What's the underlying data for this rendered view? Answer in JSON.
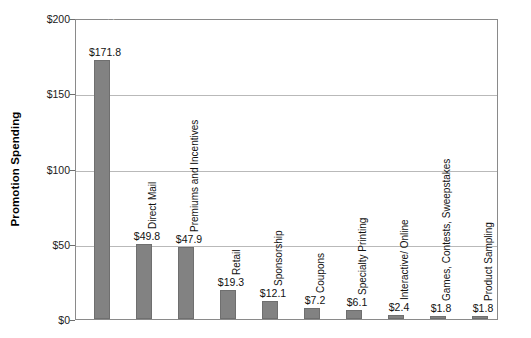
{
  "chart_data": {
    "type": "bar",
    "title": "",
    "xlabel": "",
    "ylabel": "Promotion Spending",
    "ylim": [
      0,
      200
    ],
    "ytick_labels": [
      "$200",
      "$150",
      "$100",
      "$50",
      "$0"
    ],
    "ytick_values": [
      200,
      150,
      100,
      50,
      0
    ],
    "grid": true,
    "legend": "none",
    "orientation": "vertical",
    "bar_color": "#828282",
    "categories": [
      "Event Marketing",
      "Direct Mail",
      "Premiums and Incentives",
      "Retail",
      "Sponsorship",
      "Coupons",
      "Specialty Printing",
      "Interactive/ Online",
      "Games, Contests, Sweepstakes",
      "Product Sampling"
    ],
    "values": [
      171.8,
      49.8,
      47.9,
      19.3,
      12.1,
      7.2,
      6.1,
      2.4,
      1.8,
      1.8
    ],
    "value_labels": [
      "$171.8",
      "$49.8",
      "$47.9",
      "$19.3",
      "$12.1",
      "$7.2",
      "$6.1",
      "$2.4",
      "$1.8",
      "$1.8"
    ],
    "label_placement": [
      "inside",
      "outside",
      "outside",
      "outside",
      "outside",
      "outside",
      "outside",
      "outside",
      "outside",
      "outside"
    ]
  }
}
